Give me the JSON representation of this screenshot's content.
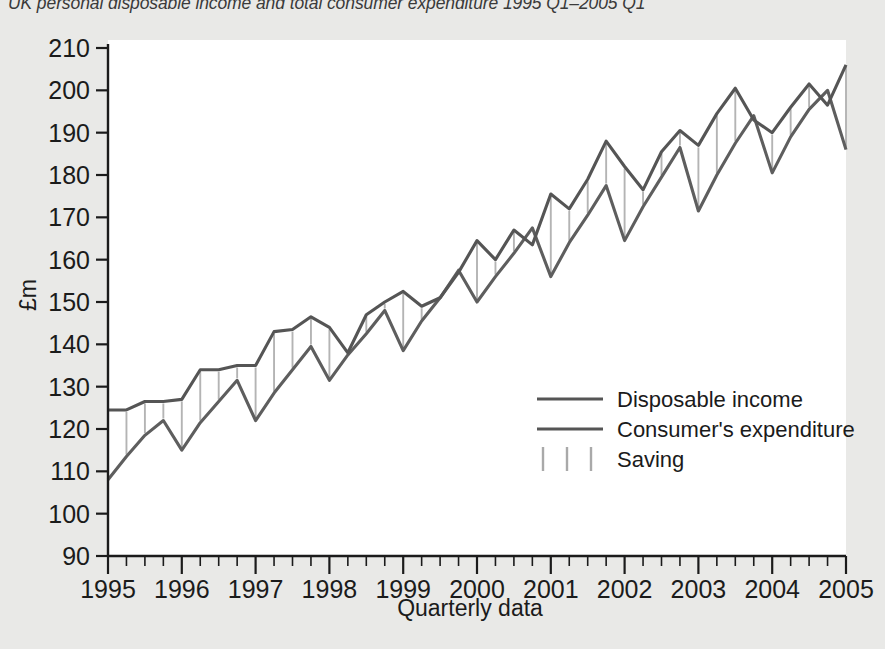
{
  "figure": {
    "caption": "UK personal disposable income and total consumer expenditure 1995 Q1–2005 Q1",
    "background_color": "#e9e9e7",
    "plot_background_color": "#ffffff"
  },
  "axes": {
    "y_title": "£m",
    "x_title": "Quarterly data",
    "y_ticks": [
      "210",
      "200",
      "190",
      "180",
      "170",
      "160",
      "150",
      "140",
      "130",
      "120",
      "110",
      "100",
      "90"
    ],
    "x_ticks": [
      "1995",
      "1996",
      "1997",
      "1998",
      "1999",
      "2000",
      "2001",
      "2002",
      "2003",
      "2004",
      "2005"
    ]
  },
  "legend": {
    "items": [
      {
        "label": "Disposable income",
        "marker": "line",
        "color": "#555555"
      },
      {
        "label": "Consumer's expenditure",
        "marker": "line",
        "color": "#5e5e5e"
      },
      {
        "label": "Saving",
        "marker": "vertical-hatch",
        "color": "#a9a9a9"
      }
    ]
  },
  "chart_data": {
    "type": "line",
    "title": "UK personal disposable income and total consumer expenditure 1995 Q1–2005 Q1",
    "xlabel": "Quarterly data",
    "ylabel": "£m",
    "ylim": [
      90,
      210
    ],
    "xlim": [
      "1995 Q1",
      "2005 Q1"
    ],
    "grid": false,
    "legend_position": "inside-right",
    "x": [
      "1995 Q1",
      "1995 Q2",
      "1995 Q3",
      "1995 Q4",
      "1996 Q1",
      "1996 Q2",
      "1996 Q3",
      "1996 Q4",
      "1997 Q1",
      "1997 Q2",
      "1997 Q3",
      "1997 Q4",
      "1998 Q1",
      "1998 Q2",
      "1998 Q3",
      "1998 Q4",
      "1999 Q1",
      "1999 Q2",
      "1999 Q3",
      "1999 Q4",
      "2000 Q1",
      "2000 Q2",
      "2000 Q3",
      "2000 Q4",
      "2001 Q1",
      "2001 Q2",
      "2001 Q3",
      "2001 Q4",
      "2002 Q1",
      "2002 Q2",
      "2002 Q3",
      "2002 Q4",
      "2003 Q1",
      "2003 Q2",
      "2003 Q3",
      "2003 Q4",
      "2004 Q1",
      "2004 Q2",
      "2004 Q3",
      "2004 Q4",
      "2005 Q1"
    ],
    "series": [
      {
        "name": "Disposable income",
        "color": "#555555",
        "values": [
          124.5,
          124.5,
          126.5,
          126.5,
          127.0,
          134.0,
          134.0,
          135.0,
          135.0,
          143.0,
          143.5,
          146.5,
          144.0,
          138.0,
          147.0,
          150.0,
          152.5,
          149.0,
          151.0,
          157.0,
          164.5,
          160.0,
          167.0,
          163.5,
          175.5,
          172.0,
          179.0,
          188.0,
          182.0,
          176.5,
          185.5,
          190.5,
          187.0,
          194.5,
          200.5,
          193.0,
          190.0,
          196.0,
          201.5,
          196.5,
          206.0
        ]
      },
      {
        "name": "Consumer's expenditure",
        "color": "#5e5e5e",
        "values": [
          108.0,
          113.5,
          118.5,
          122.0,
          115.0,
          121.5,
          126.5,
          131.5,
          122.0,
          128.5,
          134.0,
          139.5,
          131.5,
          137.5,
          142.5,
          148.0,
          138.5,
          145.5,
          151.0,
          157.5,
          150.0,
          156.0,
          161.5,
          167.5,
          156.0,
          164.0,
          170.5,
          177.5,
          164.5,
          172.5,
          179.5,
          186.5,
          171.5,
          180.0,
          187.5,
          194.0,
          180.5,
          189.0,
          195.5,
          200.0,
          186.0
        ]
      }
    ],
    "saving_note": "Vertical lines between the two series indicate saving (disposable income minus consumer's expenditure)."
  }
}
